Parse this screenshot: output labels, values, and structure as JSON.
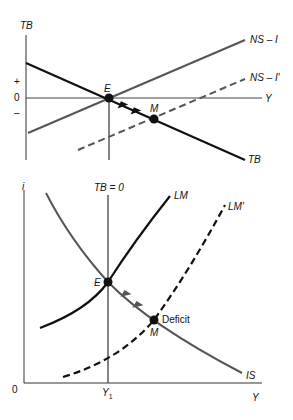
{
  "top_panel": {
    "y_axis_label": "TB",
    "x_axis_label": "Y",
    "tick_plus": "+",
    "tick_zero": "0",
    "tick_minus": "–",
    "curves": {
      "ns_i": "NS – I",
      "ns_i_prime": "NS – I′",
      "tb": "TB"
    },
    "points": {
      "e": "E",
      "m": "M"
    }
  },
  "bottom_panel": {
    "y_axis_label": "i",
    "x_axis_label": "Y",
    "origin_label": "0",
    "x_tick_label": "Y",
    "x_tick_subscript": "1",
    "vertical_line_label": "TB = 0",
    "curves": {
      "lm": "LM",
      "lm_prime": "LM′",
      "is": "IS"
    },
    "points": {
      "e": "E",
      "m": "M"
    },
    "annotation": "Deficit"
  },
  "colors": {
    "black_line": "#111111",
    "gray_line": "#555555",
    "axis": "#333333"
  }
}
